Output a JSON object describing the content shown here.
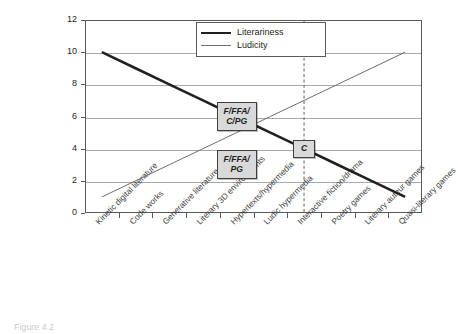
{
  "chart_data": {
    "type": "line",
    "title": "",
    "subtitle": "",
    "xlabel": "",
    "ylabel": "",
    "ylim": [
      0,
      12
    ],
    "yticks": [
      0,
      2,
      4,
      6,
      8,
      10,
      12
    ],
    "grid": "horizontal",
    "legend_position": "top-center-inside",
    "categories": [
      "Kinetic digital literature",
      "Code works",
      "Generative literature",
      "Literary 3D environments",
      "Hypertexts/hypermedia",
      "Ludic hypermedia",
      "Interactive fiction/drama",
      "Poetry games",
      "Literary auteur games",
      "Quasi-literary games"
    ],
    "series": [
      {
        "name": "Literariness",
        "style": "thick",
        "color": "#231f20",
        "values": [
          10,
          9,
          8,
          7,
          6,
          5,
          4,
          3,
          2,
          1
        ]
      },
      {
        "name": "Ludicity",
        "style": "thin",
        "color": "#6d6e71",
        "values": [
          1,
          2,
          3,
          4,
          5,
          6,
          7,
          8,
          9,
          10
        ]
      }
    ],
    "reference_line": {
      "label": "",
      "at_category": "Interactive fiction/drama",
      "style": "dashed",
      "color": "#6d6e71"
    },
    "annotations": [
      {
        "text": "F/FFA/\nC/PG",
        "value_y": 6,
        "near_category": "Hypertexts/hypermedia"
      },
      {
        "text": "F/FFA/\nPG",
        "value_y": 3,
        "near_category": "Hypertexts/hypermedia"
      },
      {
        "text": "C",
        "value_y": 4,
        "near_category": "Interactive fiction/drama"
      }
    ]
  },
  "caption": {
    "text": "Figure 4.2"
  },
  "icons": {
    "reference_line": "dashed-vertical-line-icon",
    "legend_thick": "thick-line-swatch-icon",
    "legend_thin": "thin-line-swatch-icon"
  }
}
